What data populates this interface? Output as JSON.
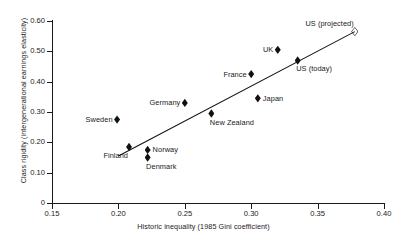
{
  "chart_data": {
    "type": "scatter",
    "title": "",
    "xlabel": "Historic inequality (1985 Gini coefficient)",
    "ylabel": "Class rigidity (intergenerational earnings elasticity)",
    "xlim": [
      0.15,
      0.4
    ],
    "ylim": [
      0.0,
      0.6
    ],
    "xticks": [
      "0.15",
      "0.20",
      "0.25",
      "0.30",
      "0.35",
      "0.40"
    ],
    "xtick_values": [
      0.15,
      0.2,
      0.25,
      0.3,
      0.35,
      0.4
    ],
    "yticks": [
      "0",
      "0.10",
      "0.20",
      "0.30",
      "0.40",
      "0.50",
      "0.60"
    ],
    "ytick_values": [
      0,
      0.1,
      0.2,
      0.3,
      0.4,
      0.5,
      0.6
    ],
    "grid": false,
    "legend": "none",
    "points": [
      {
        "label": "Sweden",
        "x": 0.199,
        "y": 0.275,
        "marker": "filled-diamond",
        "label_pos": "left"
      },
      {
        "label": "Finland",
        "x": 0.208,
        "y": 0.185,
        "marker": "filled-diamond",
        "label_pos": "below-left"
      },
      {
        "label": "Norway",
        "x": 0.222,
        "y": 0.175,
        "marker": "filled-diamond",
        "label_pos": "right"
      },
      {
        "label": "Denmark",
        "x": 0.222,
        "y": 0.15,
        "marker": "filled-diamond",
        "label_pos": "below-right"
      },
      {
        "label": "Germany",
        "x": 0.25,
        "y": 0.33,
        "marker": "filled-diamond",
        "label_pos": "left"
      },
      {
        "label": "New Zealand",
        "x": 0.27,
        "y": 0.295,
        "marker": "filled-diamond",
        "label_pos": "below-right"
      },
      {
        "label": "France",
        "x": 0.3,
        "y": 0.425,
        "marker": "filled-diamond",
        "label_pos": "left"
      },
      {
        "label": "Japan",
        "x": 0.305,
        "y": 0.345,
        "marker": "filled-diamond",
        "label_pos": "right"
      },
      {
        "label": "UK",
        "x": 0.32,
        "y": 0.505,
        "marker": "filled-diamond",
        "label_pos": "left"
      },
      {
        "label": "US (today)",
        "x": 0.335,
        "y": 0.47,
        "marker": "filled-diamond",
        "label_pos": "below-right"
      },
      {
        "label": "US (projected)",
        "x": 0.378,
        "y": 0.565,
        "marker": "open-diamond",
        "label_pos": "above-left"
      }
    ],
    "trendline": {
      "x0": 0.2,
      "y0": 0.155,
      "x1": 0.378,
      "y1": 0.565
    }
  },
  "colors": {
    "axis": "#1a1a1a",
    "marker": "#111111",
    "text": "#1a1a1a",
    "background": "#ffffff"
  }
}
